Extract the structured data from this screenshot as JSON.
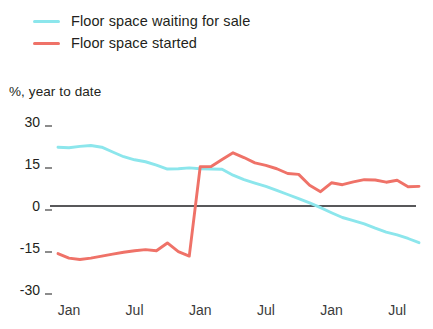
{
  "legend": {
    "items": [
      {
        "label": "Floor space waiting for sale",
        "color": "#8CE6EC",
        "icon": "line-swatch-icon"
      },
      {
        "label": "Floor space started",
        "color": "#EF7268",
        "icon": "line-swatch-icon"
      }
    ]
  },
  "axis_caption": "%, year to date",
  "colors": {
    "waiting": "#8CE6EC",
    "started": "#EF7268",
    "zero_line": "#58585a",
    "tick": "#8c8c8c"
  },
  "chart_data": {
    "type": "line",
    "title": "",
    "subtitle": "",
    "xlabel": "",
    "ylabel": "%, year to date",
    "ylim": [
      -30,
      30
    ],
    "yticks": [
      30,
      15,
      0,
      -15,
      -30
    ],
    "ytick_labels": [
      "30",
      "15",
      "0",
      "-15",
      "-30"
    ],
    "grid": false,
    "zero_line": 0,
    "legend_position": "top-left",
    "x_tick_labels": [
      "Jan",
      "Jul",
      "Jan",
      "Jul",
      "Jan",
      "Jul"
    ],
    "x_tick_index": [
      1,
      7,
      13,
      19,
      25,
      31
    ],
    "x": [
      0,
      1,
      2,
      3,
      4,
      5,
      6,
      7,
      8,
      9,
      10,
      11,
      12,
      13,
      14,
      15,
      16,
      17,
      18,
      19,
      20,
      21,
      22,
      23,
      24,
      25,
      26,
      27,
      28,
      29,
      30,
      31,
      32,
      33
    ],
    "series": [
      {
        "name": "Floor space waiting for sale",
        "color": "#8CE6EC",
        "values": [
          21.0,
          20.8,
          21.3,
          21.6,
          21.0,
          19.3,
          17.6,
          16.5,
          15.8,
          14.6,
          13.2,
          13.3,
          13.6,
          13.3,
          13.2,
          13.1,
          11.0,
          9.4,
          8.2,
          7.0,
          5.6,
          4.1,
          2.6,
          1.1,
          -0.6,
          -2.4,
          -4.1,
          -5.2,
          -6.4,
          -7.9,
          -9.3,
          -10.3,
          -11.6,
          -13.1
        ]
      },
      {
        "name": "Floor space started",
        "color": "#EF7268",
        "values": [
          -17.0,
          -18.6,
          -19.1,
          -18.6,
          -17.9,
          -17.2,
          -16.5,
          -16.0,
          -15.6,
          -16.0,
          -13.2,
          -16.3,
          -17.9,
          14.0,
          14.1,
          16.6,
          19.0,
          17.3,
          15.4,
          14.5,
          13.3,
          11.6,
          11.3,
          7.4,
          5.1,
          8.3,
          7.6,
          8.6,
          9.4,
          9.3,
          8.5,
          9.2,
          6.9,
          7.0
        ]
      }
    ]
  }
}
